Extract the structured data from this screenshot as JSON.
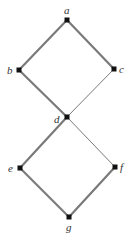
{
  "diagram": {
    "type": "hasse-diagram",
    "nodes": [
      {
        "id": "a",
        "label": "a",
        "x": 67,
        "y": 20,
        "lx": 64,
        "ly": 14
      },
      {
        "id": "b",
        "label": "b",
        "x": 19,
        "y": 70,
        "lx": 7,
        "ly": 74
      },
      {
        "id": "c",
        "label": "c",
        "x": 114,
        "y": 69,
        "lx": 119,
        "ly": 73
      },
      {
        "id": "d",
        "label": "d",
        "x": 67,
        "y": 117,
        "lx": 54,
        "ly": 123
      },
      {
        "id": "e",
        "label": "e",
        "x": 20,
        "y": 168,
        "lx": 8,
        "ly": 172
      },
      {
        "id": "f",
        "label": "f",
        "x": 115,
        "y": 167,
        "lx": 120,
        "ly": 171
      },
      {
        "id": "g",
        "label": "g",
        "x": 69,
        "y": 217,
        "lx": 66,
        "ly": 231
      }
    ],
    "edges": [
      {
        "from": "a",
        "to": "b",
        "weight": "thick"
      },
      {
        "from": "a",
        "to": "c",
        "weight": "thick"
      },
      {
        "from": "b",
        "to": "d",
        "weight": "thick"
      },
      {
        "from": "c",
        "to": "d",
        "weight": "thin"
      },
      {
        "from": "d",
        "to": "e",
        "weight": "thick"
      },
      {
        "from": "d",
        "to": "f",
        "weight": "thin"
      },
      {
        "from": "e",
        "to": "g",
        "weight": "thick"
      },
      {
        "from": "f",
        "to": "g",
        "weight": "thick"
      }
    ],
    "colors": {
      "edge": "#7a7a7a",
      "node": "#111111",
      "label": "#333333"
    }
  }
}
